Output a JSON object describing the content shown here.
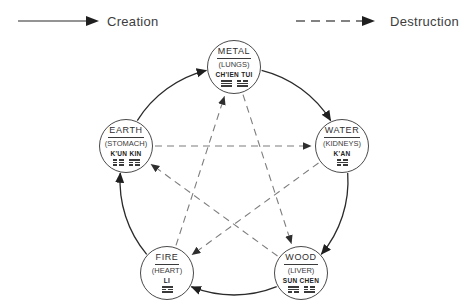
{
  "legend": {
    "creation": {
      "label": "Creation",
      "line_style": "solid"
    },
    "destruction": {
      "label": "Destruction",
      "line_style": "dashed"
    }
  },
  "colors": {
    "solid_line": "#2b2b2b",
    "dashed_line": "#7d7d7d",
    "arrowhead": "#1f1f1f",
    "circle_stroke": "#4a4a4a",
    "text": "#333333",
    "background": "#ffffff"
  },
  "nodes": [
    {
      "id": "metal",
      "element": "METAL",
      "organ": "(LUNGS)",
      "trigram_names": "CH'IEN TUI",
      "trigrams": [
        [
          "solid",
          "solid",
          "solid"
        ],
        [
          "broken",
          "solid",
          "solid"
        ]
      ]
    },
    {
      "id": "water",
      "element": "WATER",
      "organ": "(KIDNEYS)",
      "trigram_names": "K'AN",
      "trigrams": [
        [
          "broken",
          "solid",
          "broken"
        ]
      ]
    },
    {
      "id": "wood",
      "element": "WOOD",
      "organ": "(LIVER)",
      "trigram_names": "SUN CHEN",
      "trigrams": [
        [
          "solid",
          "solid",
          "broken"
        ],
        [
          "broken",
          "broken",
          "solid"
        ]
      ]
    },
    {
      "id": "fire",
      "element": "FIRE",
      "organ": "(HEART)",
      "trigram_names": "LI",
      "trigrams": [
        [
          "solid",
          "broken",
          "solid"
        ]
      ]
    },
    {
      "id": "earth",
      "element": "EARTH",
      "organ": "(STOMACH)",
      "trigram_names": "K'UN KIN",
      "trigrams": [
        [
          "broken",
          "broken",
          "broken"
        ],
        [
          "solid",
          "broken",
          "broken"
        ]
      ]
    }
  ],
  "creation_arrows": [
    {
      "from": "metal",
      "to": "water"
    },
    {
      "from": "water",
      "to": "wood"
    },
    {
      "from": "wood",
      "to": "fire"
    },
    {
      "from": "fire",
      "to": "earth"
    },
    {
      "from": "earth",
      "to": "metal"
    }
  ],
  "destruction_arrows": [
    {
      "from": "metal",
      "to": "wood"
    },
    {
      "from": "wood",
      "to": "earth"
    },
    {
      "from": "earth",
      "to": "water"
    },
    {
      "from": "water",
      "to": "fire"
    },
    {
      "from": "fire",
      "to": "metal"
    }
  ]
}
